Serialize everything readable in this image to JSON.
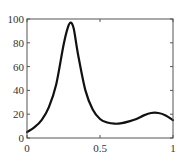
{
  "chart_data": {
    "type": "line",
    "title": "",
    "xlabel": "",
    "ylabel": "",
    "xlim": [
      0,
      1
    ],
    "ylim": [
      0,
      100
    ],
    "grid": false,
    "legend": null,
    "x_ticks": [
      0,
      0.5,
      1
    ],
    "x_tick_labels": [
      "0",
      "0.5",
      "1"
    ],
    "y_ticks": [
      0,
      20,
      40,
      60,
      80,
      100
    ],
    "y_tick_labels": [
      "0",
      "20",
      "40",
      "60",
      "80",
      "100"
    ],
    "series": [
      {
        "name": "curve",
        "color": "#111111",
        "x": [
          0,
          0.05,
          0.1,
          0.15,
          0.2,
          0.25,
          0.28,
          0.3,
          0.32,
          0.35,
          0.4,
          0.45,
          0.5,
          0.55,
          0.6,
          0.65,
          0.7,
          0.75,
          0.8,
          0.85,
          0.9,
          0.95,
          1.0
        ],
        "y": [
          5,
          9,
          15,
          26,
          45,
          78,
          93,
          97,
          92,
          70,
          40,
          24,
          16,
          13,
          12,
          12.5,
          14,
          16,
          19,
          21,
          21,
          19,
          15
        ]
      }
    ]
  }
}
